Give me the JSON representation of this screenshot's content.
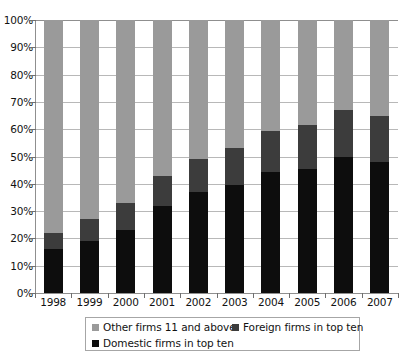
{
  "chart_data": {
    "type": "bar",
    "subtype": "stacked-bar-100-percent",
    "title": "",
    "subtitle": "",
    "xlabel": "",
    "ylabel": "",
    "categories": [
      "1998",
      "1999",
      "2000",
      "2001",
      "2002",
      "2003",
      "2004",
      "2005",
      "2006",
      "2007"
    ],
    "series": [
      {
        "name": "Domestic firms in top ten",
        "color": "#0d0d0d",
        "values": [
          16,
          19,
          23,
          32,
          37,
          39.5,
          44.5,
          45.5,
          50,
          48
        ]
      },
      {
        "name": "Foreign firms in top ten",
        "color": "#3c3c3c",
        "values": [
          6,
          8,
          10,
          11,
          12,
          13.5,
          15,
          16,
          17,
          17
        ]
      },
      {
        "name": "Other firms 11 and above",
        "color": "#9a9a9a",
        "values": [
          78,
          73,
          67,
          57,
          51,
          47,
          40.5,
          38.5,
          33,
          35
        ]
      }
    ],
    "ylim": [
      0,
      100
    ],
    "ytick_values": [
      0,
      10,
      20,
      30,
      40,
      50,
      60,
      70,
      80,
      90,
      100
    ],
    "ytick_labels": [
      "0%",
      "10%",
      "20%",
      "30%",
      "40%",
      "50%",
      "60%",
      "70%",
      "80%",
      "90%",
      "100%"
    ],
    "grid": true,
    "grid_axis": "y",
    "legend_position": "bottom",
    "stack_order_bottom_to_top": [
      "Domestic firms in top ten",
      "Foreign firms in top ten",
      "Other firms 11 and above"
    ]
  },
  "legend": {
    "items": [
      {
        "label": "Other firms 11 and above",
        "color": "#9a9a9a"
      },
      {
        "label": "Foreign firms in top ten",
        "color": "#3c3c3c"
      },
      {
        "label": "Domestic firms in top ten",
        "color": "#0d0d0d"
      }
    ]
  },
  "colors": {
    "domestic": "#0d0d0d",
    "foreign": "#3c3c3c",
    "other": "#9a9a9a",
    "gridline": "#b8b8b8",
    "axis": "#8f8f8f",
    "text": "#121212",
    "legend_border": "#a6a6a6",
    "background": "#ffffff"
  }
}
